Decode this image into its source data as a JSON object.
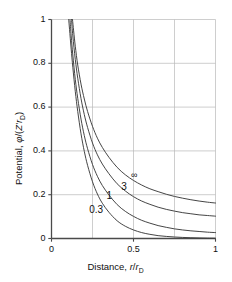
{
  "chart_data": {
    "type": "line",
    "title": "",
    "xlabel": "Distance, r/rD",
    "ylabel": "Potential, φ/(Z'rD)",
    "xlim": [
      0,
      1
    ],
    "ylim": [
      0,
      1
    ],
    "xticks": [
      "0",
      "0.5",
      "1"
    ],
    "xtick_values": [
      0,
      0.5,
      1
    ],
    "yticks": [
      "0",
      "0.2",
      "0.4",
      "0.6",
      "0.8",
      "1"
    ],
    "ytick_values": [
      0,
      0.2,
      0.4,
      0.6,
      0.8,
      1
    ],
    "grid": true,
    "gridlines_x": [
      0.25,
      0.5,
      0.75
    ],
    "gridlines_y": [
      0.2,
      0.4,
      0.6,
      0.8
    ],
    "legend_position": "inline-annotations",
    "line_color": "#3b3b3b",
    "grid_color": "#b9b9b9",
    "axis_color": "#555555",
    "series": [
      {
        "name": "0.3",
        "label": "0.3",
        "label_x": 0.23,
        "label_y": 0.13,
        "x": [
          0.105,
          0.11,
          0.12,
          0.13,
          0.145,
          0.16,
          0.18,
          0.2,
          0.22,
          0.25,
          0.28,
          0.31,
          0.35,
          0.4,
          0.45,
          0.5,
          0.55,
          0.6,
          0.65,
          0.7,
          0.75,
          0.8,
          0.85,
          0.9,
          0.95,
          1.0
        ],
        "y": [
          1.0,
          0.955,
          0.865,
          0.782,
          0.672,
          0.58,
          0.478,
          0.398,
          0.334,
          0.259,
          0.203,
          0.161,
          0.12,
          0.081,
          0.056,
          0.039,
          0.027,
          0.019,
          0.013,
          0.0095,
          0.0068,
          0.0049,
          0.0035,
          0.0025,
          0.0018,
          0.0013
        ]
      },
      {
        "name": "1",
        "label": "1",
        "label_x": 0.335,
        "label_y": 0.195,
        "x": [
          0.113,
          0.12,
          0.13,
          0.145,
          0.16,
          0.18,
          0.2,
          0.22,
          0.25,
          0.28,
          0.31,
          0.35,
          0.4,
          0.45,
          0.5,
          0.55,
          0.6,
          0.65,
          0.7,
          0.75,
          0.8,
          0.85,
          0.9,
          0.95,
          1.0
        ],
        "y": [
          1.0,
          0.925,
          0.838,
          0.727,
          0.64,
          0.545,
          0.47,
          0.41,
          0.338,
          0.284,
          0.242,
          0.199,
          0.155,
          0.124,
          0.101,
          0.083,
          0.07,
          0.059,
          0.051,
          0.044,
          0.039,
          0.035,
          0.032,
          0.029,
          0.027
        ]
      },
      {
        "name": "3",
        "label": "3",
        "label_x": 0.425,
        "label_y": 0.235,
        "x": [
          0.122,
          0.13,
          0.145,
          0.16,
          0.18,
          0.2,
          0.22,
          0.25,
          0.28,
          0.31,
          0.35,
          0.4,
          0.45,
          0.5,
          0.55,
          0.6,
          0.65,
          0.7,
          0.75,
          0.8,
          0.85,
          0.9,
          0.95,
          1.0
        ],
        "y": [
          1.0,
          0.925,
          0.818,
          0.732,
          0.639,
          0.566,
          0.507,
          0.436,
          0.382,
          0.34,
          0.296,
          0.25,
          0.217,
          0.191,
          0.171,
          0.156,
          0.143,
          0.133,
          0.125,
          0.118,
          0.113,
          0.108,
          0.105,
          0.102
        ]
      },
      {
        "name": "infinity",
        "label": "∞",
        "label_x": 0.485,
        "label_y": 0.287,
        "x": [
          0.128,
          0.135,
          0.145,
          0.16,
          0.18,
          0.2,
          0.22,
          0.25,
          0.28,
          0.31,
          0.35,
          0.4,
          0.45,
          0.5,
          0.55,
          0.6,
          0.65,
          0.7,
          0.75,
          0.8,
          0.85,
          0.9,
          0.95,
          1.0
        ],
        "y": [
          1.0,
          0.948,
          0.878,
          0.792,
          0.705,
          0.637,
          0.58,
          0.512,
          0.458,
          0.416,
          0.371,
          0.325,
          0.291,
          0.265,
          0.244,
          0.227,
          0.214,
          0.202,
          0.192,
          0.184,
          0.177,
          0.171,
          0.166,
          0.162
        ]
      }
    ]
  },
  "axes": {
    "ylabel_prefix": "Potential, ",
    "ylabel_phi": "φ",
    "ylabel_rest_open": "/(",
    "ylabel_z": "Z'",
    "ylabel_r": "r",
    "ylabel_sub": "D",
    "ylabel_close": ")",
    "xlabel_prefix": "Distance, ",
    "xlabel_r1": "r",
    "xlabel_slash": "/",
    "xlabel_r2": "r",
    "xlabel_sub": "D"
  }
}
